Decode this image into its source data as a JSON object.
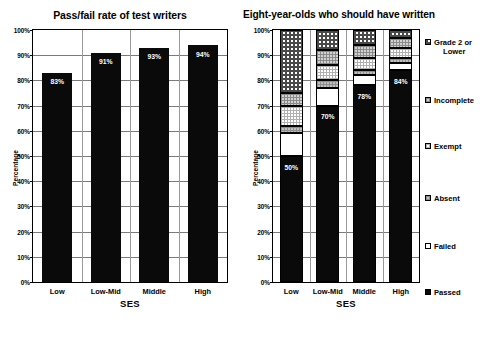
{
  "chart_data": [
    {
      "type": "bar",
      "title": "Pass/fail rate of test writers",
      "xlabel": "SES",
      "ylabel": "Percentage",
      "categories": [
        "Low",
        "Low-Mid",
        "Middle",
        "High"
      ],
      "values": [
        83,
        91,
        93,
        94
      ],
      "value_labels": [
        "83%",
        "91%",
        "93%",
        "94%"
      ],
      "ylim": [
        0,
        100
      ],
      "ytick_labels": [
        "0%",
        "10%",
        "20%",
        "30%",
        "40%",
        "50%",
        "60%",
        "70%",
        "80%",
        "90%",
        "100%"
      ],
      "ytick_values": [
        0,
        10,
        20,
        30,
        40,
        50,
        60,
        70,
        80,
        90,
        100
      ],
      "grid": true,
      "legend": "none",
      "series_name": "Passed"
    },
    {
      "type": "bar",
      "subtype": "stacked-100",
      "title": "Eight-year-olds who should have written",
      "xlabel": "SES",
      "ylabel": "Percentage",
      "categories": [
        "Low",
        "Low-Mid",
        "Middle",
        "High"
      ],
      "ylim": [
        0,
        100
      ],
      "ytick_labels": [
        "0%",
        "10%",
        "20%",
        "30%",
        "40%",
        "50%",
        "60%",
        "70%",
        "80%",
        "90%",
        "100%"
      ],
      "ytick_values": [
        0,
        10,
        20,
        30,
        40,
        50,
        60,
        70,
        80,
        90,
        100
      ],
      "grid": true,
      "legend": "right",
      "series": [
        {
          "name": "Passed",
          "fill": "f-passed",
          "values": [
            50,
            70,
            78,
            84
          ]
        },
        {
          "name": "Failed",
          "fill": "f-failed",
          "values": [
            9,
            7,
            4,
            3
          ]
        },
        {
          "name": "Absent",
          "fill": "f-absent",
          "values": [
            3,
            3,
            2,
            2
          ]
        },
        {
          "name": "Exempt",
          "fill": "f-exempt",
          "values": [
            8,
            6,
            5,
            4
          ]
        },
        {
          "name": "Incomplete",
          "fill": "f-incomplete",
          "values": [
            5,
            6,
            5,
            4
          ]
        },
        {
          "name": "Grade 2 or Lower",
          "fill": "f-grade2",
          "values": [
            25,
            8,
            6,
            3
          ]
        }
      ],
      "value_labels": [
        "50%",
        "70%",
        "78%",
        "84%"
      ],
      "legend_entries": [
        {
          "label": "Grade 2 or",
          "label_line2": "Lower",
          "fill": "f-grade2"
        },
        {
          "label": "Incomplete",
          "fill": "f-incomplete"
        },
        {
          "label": "Exempt",
          "fill": "f-exempt"
        },
        {
          "label": "Absent",
          "fill": "f-absent"
        },
        {
          "label": "Failed",
          "fill": "f-failed"
        },
        {
          "label": "Passed",
          "fill": "f-passed"
        }
      ]
    }
  ],
  "left_chart": {
    "title": "Pass/fail rate of test writers",
    "ylabel": "Percentage",
    "xlabel": "SES",
    "yticks": [
      "100%",
      "90%",
      "80%",
      "70%",
      "60%",
      "50%",
      "40%",
      "30%",
      "20%",
      "10%",
      "0%"
    ],
    "xticks": [
      "Low",
      "Low-Mid",
      "Middle",
      "High"
    ],
    "bar_labels": [
      "83%",
      "91%",
      "93%",
      "94%"
    ]
  },
  "right_chart": {
    "title": "Eight-year-olds who should have written",
    "ylabel": "Percentage",
    "xlabel": "SES",
    "yticks": [
      "100%",
      "90%",
      "80%",
      "70%",
      "60%",
      "50%",
      "40%",
      "30%",
      "20%",
      "10%",
      "0%"
    ],
    "xticks": [
      "Low",
      "Low-Mid",
      "Middle",
      "High"
    ],
    "bar_labels": [
      "50%",
      "70%",
      "78%",
      "84%"
    ],
    "legend": [
      {
        "line1": "Grade 2 or",
        "line2": "Lower"
      },
      {
        "line1": "Incomplete",
        "line2": ""
      },
      {
        "line1": "Exempt",
        "line2": ""
      },
      {
        "line1": "Absent",
        "line2": ""
      },
      {
        "line1": "Failed",
        "line2": ""
      },
      {
        "line1": "Passed",
        "line2": ""
      }
    ]
  }
}
